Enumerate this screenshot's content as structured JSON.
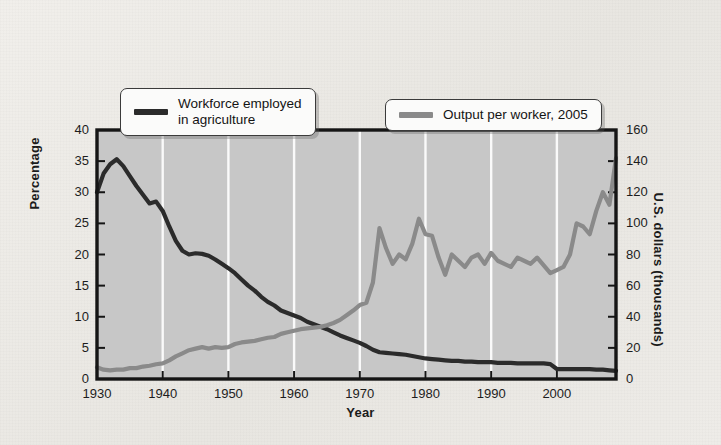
{
  "chart_data": {
    "type": "line",
    "title": "",
    "xlabel": "Year",
    "ylabel": "Percentage",
    "ylabel_secondary": "U.S. dollars (thousands)",
    "xlim": [
      1930,
      2009
    ],
    "ylim": [
      0,
      40
    ],
    "ylim_secondary": [
      0,
      160
    ],
    "xticks": [
      1930,
      1940,
      1950,
      1960,
      1970,
      1980,
      1990,
      2000
    ],
    "yticks": [
      0,
      5,
      10,
      15,
      20,
      25,
      30,
      35,
      40
    ],
    "yticks_secondary": [
      0,
      20,
      40,
      60,
      80,
      100,
      120,
      140,
      160
    ],
    "grid": "vertical-white-at-decades",
    "legend_position": "top-inside",
    "series": [
      {
        "name": "Workforce employed in agriculture",
        "axis": "left",
        "units": "percent",
        "color": "#2b2b2b",
        "x": [
          1930,
          1931,
          1932,
          1933,
          1934,
          1935,
          1936,
          1937,
          1938,
          1939,
          1940,
          1941,
          1942,
          1943,
          1944,
          1945,
          1946,
          1947,
          1948,
          1949,
          1950,
          1951,
          1952,
          1953,
          1954,
          1955,
          1956,
          1957,
          1958,
          1959,
          1960,
          1961,
          1962,
          1963,
          1964,
          1965,
          1966,
          1967,
          1968,
          1969,
          1970,
          1971,
          1972,
          1973,
          1974,
          1975,
          1976,
          1977,
          1978,
          1979,
          1980,
          1981,
          1982,
          1983,
          1984,
          1985,
          1986,
          1987,
          1988,
          1989,
          1990,
          1991,
          1992,
          1993,
          1994,
          1995,
          1996,
          1997,
          1998,
          1999,
          2000,
          2001,
          2002,
          2003,
          2004,
          2005,
          2006,
          2007,
          2008,
          2009
        ],
        "values": [
          30.0,
          33.0,
          34.5,
          35.3,
          34.2,
          32.6,
          31.0,
          29.6,
          28.2,
          28.5,
          27.0,
          24.5,
          22.2,
          20.6,
          20.0,
          20.2,
          20.1,
          19.8,
          19.2,
          18.5,
          17.8,
          17.0,
          16.0,
          15.0,
          14.2,
          13.2,
          12.4,
          11.8,
          11.0,
          10.6,
          10.2,
          9.8,
          9.2,
          8.8,
          8.4,
          8.0,
          7.5,
          7.0,
          6.6,
          6.2,
          5.8,
          5.3,
          4.7,
          4.3,
          4.2,
          4.1,
          4.0,
          3.9,
          3.7,
          3.5,
          3.3,
          3.2,
          3.1,
          3.0,
          2.9,
          2.9,
          2.8,
          2.8,
          2.7,
          2.7,
          2.7,
          2.6,
          2.6,
          2.6,
          2.5,
          2.5,
          2.5,
          2.5,
          2.5,
          2.4,
          1.6,
          1.6,
          1.6,
          1.6,
          1.6,
          1.6,
          1.5,
          1.5,
          1.4,
          1.3
        ]
      },
      {
        "name": "Output per worker, 2005",
        "axis": "right",
        "units": "thousands of U.S. dollars",
        "color": "#8a8a8a",
        "x": [
          1930,
          1931,
          1932,
          1933,
          1934,
          1935,
          1936,
          1937,
          1938,
          1939,
          1940,
          1941,
          1942,
          1943,
          1944,
          1945,
          1946,
          1947,
          1948,
          1949,
          1950,
          1951,
          1952,
          1953,
          1954,
          1955,
          1956,
          1957,
          1958,
          1959,
          1960,
          1961,
          1962,
          1963,
          1964,
          1965,
          1966,
          1967,
          1968,
          1969,
          1970,
          1971,
          1972,
          1973,
          1974,
          1975,
          1976,
          1977,
          1978,
          1979,
          1980,
          1981,
          1982,
          1983,
          1984,
          1985,
          1986,
          1987,
          1988,
          1989,
          1990,
          1991,
          1992,
          1993,
          1994,
          1995,
          1996,
          1997,
          1998,
          1999,
          2000,
          2001,
          2002,
          2003,
          2004,
          2005,
          2006,
          2007,
          2008,
          2009
        ],
        "values": [
          7.5,
          6.0,
          5.5,
          6.0,
          6.0,
          7.0,
          7.0,
          8.0,
          8.5,
          9.5,
          10.0,
          12.0,
          14.5,
          16.5,
          18.5,
          19.5,
          20.5,
          19.5,
          20.5,
          20.0,
          20.5,
          22.5,
          23.5,
          24.0,
          24.5,
          25.5,
          26.5,
          27.0,
          29.0,
          30.0,
          31.0,
          32.0,
          32.5,
          33.0,
          33.5,
          34.5,
          36.0,
          38.0,
          41.0,
          44.0,
          47.5,
          49.0,
          62.0,
          97.0,
          84.0,
          74.0,
          80.0,
          77.0,
          87.0,
          103.0,
          93.0,
          92.0,
          78.0,
          67.0,
          80.0,
          76.0,
          72.0,
          78.0,
          80.0,
          74.0,
          81.0,
          76.0,
          74.0,
          72.0,
          78.0,
          76.0,
          74.0,
          78.0,
          73.0,
          68.0,
          70.0,
          72.0,
          80.0,
          100.0,
          98.0,
          93.0,
          108.0,
          120.0,
          112.0,
          142.0
        ]
      }
    ]
  },
  "legend": {
    "items": [
      {
        "label_line1": "Workforce employed",
        "label_line2": "in agriculture",
        "color": "#2b2b2b"
      },
      {
        "label_line1": "Output per worker, 2005",
        "label_line2": "",
        "color": "#8a8a8a"
      }
    ]
  },
  "axes": {
    "left_title": "Percentage",
    "right_title": "U.S. dollars (thousands)",
    "bottom_title": "Year"
  },
  "colors": {
    "plot_background": "#c7c7c7",
    "page_background": "#ebe9e5",
    "frame": "#151515",
    "gridline": "#fafafa",
    "series_dark": "#2b2b2b",
    "series_gray": "#8a8a8a"
  }
}
